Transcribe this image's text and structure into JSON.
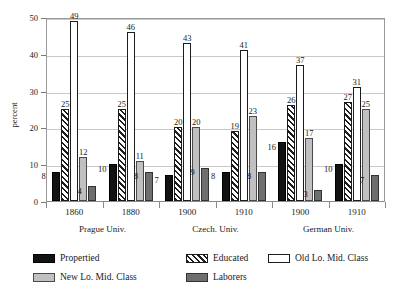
{
  "chart_data": {
    "type": "bar",
    "title": "",
    "xlabel": "",
    "ylabel": "percent",
    "ylim": [
      0,
      50
    ],
    "yticks": [
      0,
      10,
      20,
      30,
      40,
      50
    ],
    "grid": true,
    "legend_position": "bottom-left",
    "categories": [
      "1860",
      "1880",
      "1900",
      "1910",
      "1900",
      "1910"
    ],
    "group_labels": [
      "Prague Univ.",
      "Czech. Univ.",
      "German Univ."
    ],
    "group_spans": [
      2,
      2,
      2
    ],
    "series": [
      {
        "name": "Propertied",
        "fill": "black",
        "values": [
          8,
          10,
          7,
          8,
          16,
          10
        ]
      },
      {
        "name": "Educated",
        "fill": "hatched",
        "values": [
          25,
          25,
          20,
          19,
          26,
          27
        ]
      },
      {
        "name": "Old Lo. Mid. Class",
        "fill": "white",
        "values": [
          49,
          46,
          43,
          41,
          37,
          31
        ]
      },
      {
        "name": "New Lo. Mid. Class",
        "fill": "light-gray",
        "values": [
          12,
          11,
          20,
          23,
          17,
          25
        ]
      },
      {
        "name": "Laborers",
        "fill": "dark-gray",
        "values": [
          4,
          8,
          9,
          8,
          3,
          7
        ]
      }
    ],
    "colors": {
      "propertied": "#121212",
      "educated": "#1e1e1e",
      "old_lo_mid_class": "#ffffff",
      "new_lo_mid_class": "#c0c0c0",
      "laborers": "#6e6e6e",
      "grid": "#c9c9c9",
      "axis": "#8a8a8a",
      "text": "#1a1a1a"
    }
  },
  "legend": {
    "items": [
      {
        "label": "Propertied"
      },
      {
        "label": "Educated"
      },
      {
        "label": "Old Lo. Mid. Class"
      },
      {
        "label": "New Lo. Mid. Class"
      },
      {
        "label": "Laborers"
      }
    ]
  }
}
